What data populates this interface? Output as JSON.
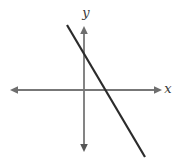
{
  "figure": {
    "title": "",
    "width": 177,
    "height": 162,
    "background_color": "#ffffff"
  },
  "axes": {
    "x_axis": {
      "label": "x",
      "label_x": 168,
      "label_y": 93,
      "color": "#777777",
      "y_position": 90,
      "start_x": 10,
      "end_x": 162,
      "arrow_start": true,
      "arrow_end": true,
      "stroke_width": 1.8
    },
    "y_axis": {
      "label": "y",
      "label_x": 86,
      "label_y": 17,
      "color": "#777777",
      "x_position": 84,
      "start_y": 26,
      "end_y": 152,
      "arrow_start": true,
      "arrow_end": true,
      "stroke_width": 1.8
    },
    "origin": {
      "x": 84,
      "y": 90
    }
  },
  "chart_data": {
    "type": "line",
    "title": "",
    "xlabel": "x",
    "ylabel": "y",
    "grid": false,
    "legend": null,
    "xlim": [
      -84,
      93
    ],
    "ylim": [
      -72,
      90
    ],
    "series": [
      {
        "name": "line",
        "color": "#2b2b2b",
        "stroke_width": 2.2,
        "points_px": [
          [
            67,
            25
          ],
          [
            145,
            157
          ]
        ],
        "x": [
          -17,
          61
        ],
        "y": [
          65,
          -67
        ],
        "slope": -1.69,
        "y_intercept_px": [
          84,
          53
        ],
        "x_intercept_px": [
          107,
          90
        ]
      }
    ]
  }
}
